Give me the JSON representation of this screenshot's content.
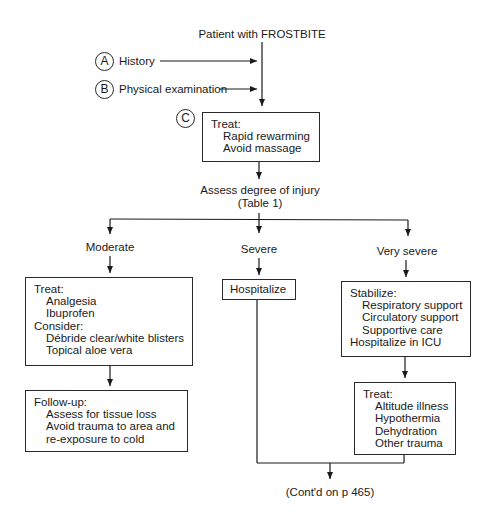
{
  "diagram": {
    "title": "Patient with FROSTBITE",
    "inputs": [
      {
        "marker": "A",
        "label": "History"
      },
      {
        "marker": "B",
        "label": "Physical examination"
      }
    ],
    "initial_treatment": {
      "marker": "C",
      "heading": "Treat:",
      "items": [
        "Rapid rewarming",
        "Avoid massage"
      ]
    },
    "assessment": {
      "line1": "Assess degree of injury",
      "line2": "(Table 1)"
    },
    "branches": {
      "moderate": {
        "label": "Moderate",
        "treat_heading": "Treat:",
        "treat_items": [
          "Analgesia",
          "Ibuprofen"
        ],
        "consider_heading": "Consider:",
        "consider_items": [
          "Débride clear/white blisters",
          "Topical aloe vera"
        ],
        "followup_heading": "Follow-up:",
        "followup_items": [
          "Assess for tissue loss",
          "Avoid trauma to area and",
          "re-exposure to cold"
        ]
      },
      "severe": {
        "label": "Severe",
        "action": "Hospitalize"
      },
      "very_severe": {
        "label": "Very severe",
        "stabilize_heading": "Stabilize:",
        "stabilize_items": [
          "Respiratory support",
          "Circulatory support",
          "Supportive care"
        ],
        "stabilize_footer": "Hospitalize in ICU",
        "treat_heading": "Treat:",
        "treat_items": [
          "Altitude illness",
          "Hypothermia",
          "Dehydration",
          "Other trauma"
        ]
      }
    },
    "continuation": "(Cont'd on p 465)"
  }
}
